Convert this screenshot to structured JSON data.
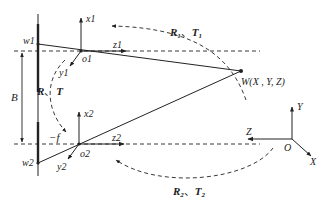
{
  "diagram": {
    "type": "stereo-camera-geometry",
    "colors": {
      "ink": "#222222",
      "background": "#ffffff"
    },
    "camera1": {
      "image_point": "w1",
      "origin": "o1",
      "axes": {
        "x": "x1",
        "y": "y1",
        "z": "z1"
      }
    },
    "camera2": {
      "image_point": "w2",
      "origin": "o2",
      "axes": {
        "x": "x2",
        "y": "y2",
        "z": "z2"
      }
    },
    "baseline_label": "B",
    "focal_label": "−f",
    "relative_transform": {
      "R": "R",
      "sep": "、",
      "T": "T"
    },
    "transform1": {
      "R": "R",
      "sub": "1",
      "sep": "、",
      "T": "T"
    },
    "transform2": {
      "R": "R",
      "sub": "2",
      "sep": "、",
      "T": "T"
    },
    "world_point": "W(X , Y, Z)",
    "world_frame": {
      "origin": "O",
      "x": "X",
      "y": "Y",
      "z": "Z"
    }
  }
}
